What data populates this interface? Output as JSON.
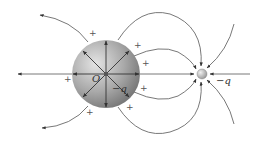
{
  "figure": {
    "sphere": {
      "center_label": "O",
      "charge_label": "−q",
      "fill_color": "#a9a9a9",
      "surface_charge_symbol": "+",
      "surface_charge_count": 7,
      "radial_arrow_count": 8
    },
    "point_charge": {
      "charge_label": "−q",
      "fill_color": "#bdbdbd"
    },
    "colors": {
      "line": "#555555",
      "text": "#333333"
    }
  }
}
